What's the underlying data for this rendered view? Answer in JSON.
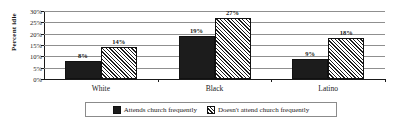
{
  "chart_data": {
    "type": "bar",
    "title": "",
    "xlabel": "",
    "ylabel": "Percent idle",
    "ylim": [
      0,
      30
    ],
    "ytick_labels": [
      "30%",
      "25%",
      "20%",
      "15%",
      "10%",
      "5%",
      "0%"
    ],
    "ytick_values": [
      30,
      25,
      20,
      15,
      10,
      5,
      0
    ],
    "grid": true,
    "legend_position": "bottom",
    "categories": [
      "White",
      "Black",
      "Latino"
    ],
    "series": [
      {
        "name": "Attends church frequently",
        "pattern": "solid",
        "color": "#1c1c1c",
        "values": [
          8,
          19,
          9
        ],
        "value_labels": [
          "8%",
          "19%",
          "9%"
        ]
      },
      {
        "name": "Doesn't attend church frequently",
        "pattern": "diagonal-hatch",
        "color": "#1c1c1c",
        "values": [
          14,
          27,
          18
        ],
        "value_labels": [
          "14%",
          "27%",
          "18%"
        ]
      }
    ]
  },
  "axis": {
    "y_title": "Percent idle"
  },
  "legend": {
    "items": [
      {
        "label": "Attends church frequently",
        "pattern": "solid"
      },
      {
        "label": "Doesn't attend church frequently",
        "pattern": "hatch"
      }
    ]
  }
}
